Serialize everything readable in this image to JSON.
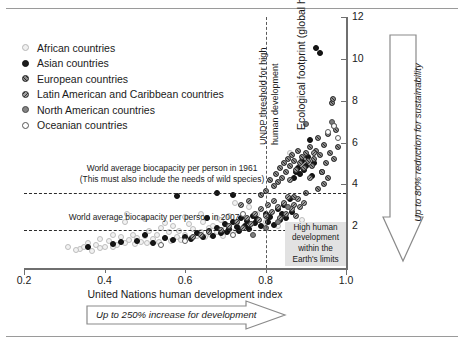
{
  "chart_data": {
    "type": "scatter",
    "title": "",
    "xlabel": "United Nations human development index",
    "ylabel": "Ecological footprint (global hectares per person)",
    "xlim": [
      0.2,
      1.0
    ],
    "ylim": [
      0,
      12
    ],
    "xticks": [
      "0.2",
      "0.4",
      "0.6",
      "0.8",
      "1.0"
    ],
    "yticks": [
      "2",
      "4",
      "6",
      "8",
      "10",
      "12"
    ],
    "grid": false,
    "legend_position": "upper-left",
    "legend": [
      {
        "key": "african",
        "label": "African countries",
        "marker": "open-light-circle"
      },
      {
        "key": "asian",
        "label": "Asian countries",
        "marker": "filled-black-circle"
      },
      {
        "key": "european",
        "label": "European countries",
        "marker": "hatched-circle"
      },
      {
        "key": "latin",
        "label": "Latin American and Caribbean countries",
        "marker": "hatched-circle"
      },
      {
        "key": "north",
        "label": "North American countries",
        "marker": "filled-grey-circle"
      },
      {
        "key": "oceanian",
        "label": "Oceanian countries",
        "marker": "open-white-circle"
      }
    ],
    "reference_lines": [
      {
        "name": "biocapacity-1961",
        "orientation": "horizontal",
        "value": 3.6,
        "label": "World average biocapacity per person in 1961",
        "sublabel": "(This must also include the needs of wild species)"
      },
      {
        "name": "biocapacity-2007",
        "orientation": "horizontal",
        "value": 1.8,
        "label": "World average biocapacity per person in 2007",
        "sublabel": ""
      },
      {
        "name": "undp-threshold",
        "orientation": "vertical",
        "value": 0.8,
        "label": "UNDP threshold for high",
        "sublabel": "human development"
      }
    ],
    "annotations": {
      "shaded_region": "High human development within the Earth's limits",
      "arrow_right": "Up to 250% increase for development",
      "arrow_down": "Up to 80% reduction for sustainability"
    },
    "series": [
      {
        "name": "African countries",
        "key": "african",
        "points": [
          [
            0.34,
            0.9
          ],
          [
            0.35,
            1.0
          ],
          [
            0.36,
            1.2
          ],
          [
            0.37,
            0.8
          ],
          [
            0.38,
            1.1
          ],
          [
            0.39,
            1.4
          ],
          [
            0.4,
            1.0
          ],
          [
            0.41,
            1.3
          ],
          [
            0.42,
            1.6
          ],
          [
            0.43,
            1.1
          ],
          [
            0.44,
            1.5
          ],
          [
            0.45,
            1.2
          ],
          [
            0.455,
            2.6
          ],
          [
            0.46,
            1.35
          ],
          [
            0.47,
            1.6
          ],
          [
            0.475,
            1.15
          ],
          [
            0.48,
            1.45
          ],
          [
            0.49,
            1.25
          ],
          [
            0.5,
            1.55
          ],
          [
            0.505,
            1.2
          ],
          [
            0.51,
            1.75
          ],
          [
            0.52,
            1.4
          ],
          [
            0.53,
            1.6
          ],
          [
            0.535,
            1.25
          ],
          [
            0.54,
            1.9
          ],
          [
            0.55,
            1.45
          ],
          [
            0.56,
            1.7
          ],
          [
            0.565,
            1.3
          ],
          [
            0.57,
            2.0
          ],
          [
            0.58,
            1.5
          ],
          [
            0.585,
            1.75
          ],
          [
            0.59,
            1.35
          ],
          [
            0.6,
            1.6
          ],
          [
            0.61,
            2.1
          ],
          [
            0.615,
            1.45
          ],
          [
            0.62,
            1.85
          ],
          [
            0.63,
            1.55
          ],
          [
            0.64,
            1.7
          ],
          [
            0.645,
            2.2
          ],
          [
            0.65,
            1.5
          ],
          [
            0.66,
            1.9
          ],
          [
            0.665,
            1.6
          ],
          [
            0.67,
            2.0
          ],
          [
            0.68,
            1.7
          ],
          [
            0.69,
            2.3
          ],
          [
            0.695,
            1.55
          ],
          [
            0.7,
            1.85
          ],
          [
            0.71,
            2.5
          ],
          [
            0.72,
            1.7
          ],
          [
            0.73,
            2.0
          ],
          [
            0.45,
            2.2
          ],
          [
            0.5,
            2.35
          ],
          [
            0.55,
            2.15
          ],
          [
            0.6,
            2.45
          ],
          [
            0.64,
            2.6
          ],
          [
            0.68,
            2.4
          ],
          [
            0.31,
            1.0
          ],
          [
            0.33,
            0.85
          ],
          [
            0.39,
            0.95
          ],
          [
            0.42,
            1.0
          ],
          [
            0.725,
            3.1
          ],
          [
            0.76,
            2.9
          ],
          [
            0.78,
            2.6
          ],
          [
            0.8,
            2.2
          ],
          [
            0.83,
            2.0
          ],
          [
            0.86,
            5.5
          ],
          [
            0.89,
            2.3
          ]
        ]
      },
      {
        "name": "Asian countries",
        "key": "asian",
        "points": [
          [
            0.36,
            1.0
          ],
          [
            0.42,
            1.15
          ],
          [
            0.48,
            1.3
          ],
          [
            0.52,
            1.2
          ],
          [
            0.55,
            1.45
          ],
          [
            0.57,
            1.35
          ],
          [
            0.58,
            3.45
          ],
          [
            0.6,
            1.5
          ],
          [
            0.615,
            1.4
          ],
          [
            0.63,
            1.65
          ],
          [
            0.645,
            1.5
          ],
          [
            0.66,
            1.75
          ],
          [
            0.67,
            1.55
          ],
          [
            0.68,
            1.9
          ],
          [
            0.69,
            1.65
          ],
          [
            0.7,
            2.1
          ],
          [
            0.705,
            1.7
          ],
          [
            0.71,
            1.85
          ],
          [
            0.72,
            2.2
          ],
          [
            0.73,
            1.95
          ],
          [
            0.735,
            1.75
          ],
          [
            0.74,
            2.4
          ],
          [
            0.75,
            2.0
          ],
          [
            0.755,
            2.25
          ],
          [
            0.76,
            1.85
          ],
          [
            0.77,
            2.5
          ],
          [
            0.775,
            2.15
          ],
          [
            0.78,
            2.35
          ],
          [
            0.79,
            2.0
          ],
          [
            0.8,
            2.6
          ],
          [
            0.805,
            2.2
          ],
          [
            0.81,
            2.45
          ],
          [
            0.82,
            2.05
          ],
          [
            0.83,
            2.8
          ],
          [
            0.835,
            2.3
          ],
          [
            0.84,
            2.6
          ],
          [
            0.845,
            3.0
          ],
          [
            0.85,
            2.4
          ],
          [
            0.86,
            3.3
          ],
          [
            0.865,
            2.7
          ],
          [
            0.87,
            4.3
          ],
          [
            0.875,
            4.6
          ],
          [
            0.88,
            4.8
          ],
          [
            0.885,
            4.5
          ],
          [
            0.89,
            5.1
          ],
          [
            0.895,
            4.7
          ],
          [
            0.9,
            4.9
          ],
          [
            0.905,
            5.3
          ],
          [
            0.91,
            6.1
          ],
          [
            0.915,
            4.4
          ],
          [
            0.92,
            5.0
          ],
          [
            0.925,
            10.5
          ],
          [
            0.935,
            10.3
          ],
          [
            0.94,
            4.6
          ],
          [
            0.68,
            3.6
          ],
          [
            0.72,
            3.5
          ],
          [
            0.655,
            2.4
          ],
          [
            0.5,
            1.6
          ],
          [
            0.44,
            1.25
          ]
        ]
      },
      {
        "name": "European countries",
        "key": "european",
        "points": [
          [
            0.79,
            3.5
          ],
          [
            0.8,
            3.7
          ],
          [
            0.81,
            4.2
          ],
          [
            0.82,
            3.9
          ],
          [
            0.825,
            4.5
          ],
          [
            0.83,
            4.1
          ],
          [
            0.835,
            4.8
          ],
          [
            0.84,
            4.3
          ],
          [
            0.845,
            5.0
          ],
          [
            0.85,
            4.6
          ],
          [
            0.855,
            5.2
          ],
          [
            0.86,
            4.9
          ],
          [
            0.865,
            5.4
          ],
          [
            0.87,
            5.1
          ],
          [
            0.875,
            4.7
          ],
          [
            0.88,
            5.6
          ],
          [
            0.885,
            5.0
          ],
          [
            0.89,
            5.3
          ],
          [
            0.895,
            4.8
          ],
          [
            0.9,
            5.5
          ],
          [
            0.905,
            5.1
          ],
          [
            0.91,
            5.8
          ],
          [
            0.915,
            4.9
          ],
          [
            0.92,
            5.2
          ],
          [
            0.925,
            5.6
          ],
          [
            0.93,
            6.2
          ],
          [
            0.935,
            5.4
          ],
          [
            0.94,
            4.6
          ],
          [
            0.945,
            5.9
          ],
          [
            0.95,
            5.0
          ],
          [
            0.955,
            6.4
          ],
          [
            0.96,
            5.5
          ],
          [
            0.965,
            7.9
          ],
          [
            0.968,
            8.1
          ],
          [
            0.97,
            5.2
          ],
          [
            0.975,
            6.6
          ],
          [
            0.98,
            5.8
          ],
          [
            0.955,
            4.3
          ],
          [
            0.945,
            4.0
          ],
          [
            0.93,
            3.8
          ],
          [
            0.9,
            3.6
          ],
          [
            0.87,
            3.4
          ]
        ]
      },
      {
        "name": "Latin American and Caribbean countries",
        "key": "latin",
        "points": [
          [
            0.69,
            1.8
          ],
          [
            0.71,
            2.0
          ],
          [
            0.73,
            2.2
          ],
          [
            0.745,
            1.9
          ],
          [
            0.755,
            2.4
          ],
          [
            0.765,
            2.1
          ],
          [
            0.775,
            2.6
          ],
          [
            0.785,
            2.3
          ],
          [
            0.79,
            2.8
          ],
          [
            0.8,
            2.5
          ],
          [
            0.805,
            3.0
          ],
          [
            0.815,
            2.7
          ],
          [
            0.82,
            3.2
          ],
          [
            0.83,
            2.9
          ],
          [
            0.835,
            2.4
          ],
          [
            0.845,
            3.1
          ],
          [
            0.85,
            2.6
          ],
          [
            0.855,
            3.4
          ],
          [
            0.865,
            2.8
          ],
          [
            0.87,
            3.0
          ],
          [
            0.875,
            2.5
          ],
          [
            0.88,
            3.3
          ],
          [
            0.885,
            2.9
          ],
          [
            0.895,
            3.1
          ],
          [
            0.66,
            1.7
          ],
          [
            0.64,
            1.6
          ],
          [
            0.62,
            1.5
          ],
          [
            0.74,
            3.0
          ],
          [
            0.76,
            3.2
          ],
          [
            0.86,
            4.2
          ],
          [
            0.92,
            5.5
          ],
          [
            0.91,
            4.3
          ]
        ]
      },
      {
        "name": "North American countries",
        "key": "north",
        "points": [
          [
            0.9,
            6.9
          ],
          [
            0.965,
            7.0
          ],
          [
            0.97,
            6.8
          ],
          [
            0.855,
            2.9
          ],
          [
            0.83,
            2.2
          ],
          [
            0.8,
            1.9
          ],
          [
            0.77,
            1.6
          ]
        ]
      },
      {
        "name": "Oceanian countries",
        "key": "oceanian",
        "points": [
          [
            0.97,
            6.8
          ],
          [
            0.955,
            6.5
          ],
          [
            0.745,
            2.6
          ],
          [
            0.72,
            1.6
          ],
          [
            0.6,
            1.3
          ],
          [
            0.54,
            1.1
          ],
          [
            0.98,
            6.2
          ]
        ]
      }
    ]
  }
}
